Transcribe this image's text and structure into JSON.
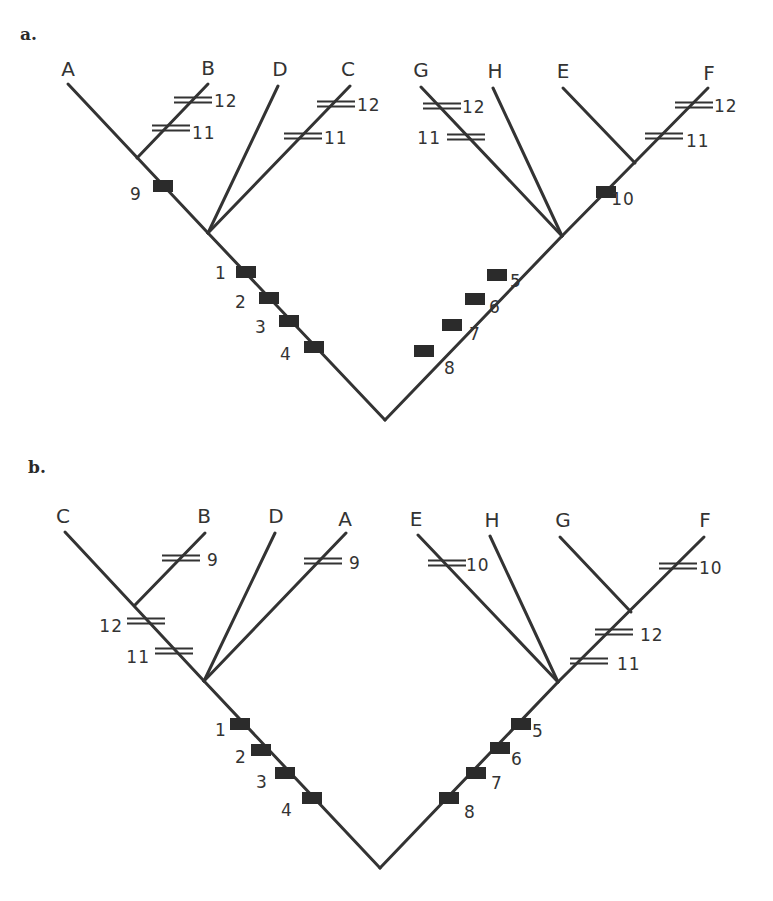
{
  "figure": {
    "panels": [
      {
        "id": "a",
        "label": "a.",
        "label_pos": [
          20,
          40
        ],
        "root": [
          385,
          420
        ],
        "branches": [
          {
            "from": [
              385,
              420
            ],
            "to": [
              208,
              233
            ]
          },
          {
            "from": [
              208,
              233
            ],
            "to": [
              68,
              84
            ]
          },
          {
            "from": [
              137,
              158
            ],
            "to": [
              208,
              84
            ]
          },
          {
            "from": [
              208,
              233
            ],
            "to": [
              278,
              86
            ]
          },
          {
            "from": [
              208,
              233
            ],
            "to": [
              350,
              86
            ]
          },
          {
            "from": [
              385,
              420
            ],
            "to": [
              562,
              236
            ]
          },
          {
            "from": [
              562,
              236
            ],
            "to": [
              421,
              87
            ]
          },
          {
            "from": [
              562,
              236
            ],
            "to": [
              493,
              88
            ]
          },
          {
            "from": [
              562,
              236
            ],
            "to": [
              708,
              88
            ]
          },
          {
            "from": [
              635,
              163
            ],
            "to": [
              563,
              88
            ]
          }
        ],
        "taxa": [
          {
            "name": "A",
            "x": 68,
            "y": 76
          },
          {
            "name": "B",
            "x": 208,
            "y": 75
          },
          {
            "name": "D",
            "x": 280,
            "y": 76
          },
          {
            "name": "C",
            "x": 348,
            "y": 76
          },
          {
            "name": "G",
            "x": 421,
            "y": 77
          },
          {
            "name": "H",
            "x": 495,
            "y": 78
          },
          {
            "name": "E",
            "x": 563,
            "y": 78
          },
          {
            "name": "F",
            "x": 709,
            "y": 80
          }
        ],
        "boxes": [
          {
            "label": "9",
            "x": 163,
            "y": 186,
            "lx": 136,
            "ly": 200
          },
          {
            "label": "1",
            "x": 246,
            "y": 272,
            "lx": 221,
            "ly": 279
          },
          {
            "label": "2",
            "x": 269,
            "y": 298,
            "lx": 241,
            "ly": 308
          },
          {
            "label": "3",
            "x": 289,
            "y": 321,
            "lx": 261,
            "ly": 333
          },
          {
            "label": "4",
            "x": 314,
            "y": 347,
            "lx": 286,
            "ly": 360
          },
          {
            "label": "10",
            "x": 606,
            "y": 192,
            "lx": 623,
            "ly": 205
          },
          {
            "label": "5",
            "x": 497,
            "y": 275,
            "lx": 516,
            "ly": 287
          },
          {
            "label": "6",
            "x": 475,
            "y": 299,
            "lx": 495,
            "ly": 313
          },
          {
            "label": "7",
            "x": 452,
            "y": 325,
            "lx": 475,
            "ly": 340
          },
          {
            "label": "8",
            "x": 424,
            "y": 351,
            "lx": 450,
            "ly": 374
          }
        ],
        "hashes": [
          {
            "label": "12",
            "x": 193,
            "y": 100,
            "lx": 214,
            "ly": 107,
            "anchor": "start"
          },
          {
            "label": "11",
            "x": 171,
            "y": 128,
            "lx": 192,
            "ly": 139,
            "anchor": "start"
          },
          {
            "label": "12",
            "x": 336,
            "y": 104,
            "lx": 357,
            "ly": 111,
            "anchor": "start"
          },
          {
            "label": "11",
            "x": 303,
            "y": 136,
            "lx": 324,
            "ly": 144,
            "anchor": "start"
          },
          {
            "label": "12",
            "x": 442,
            "y": 106,
            "lx": 462,
            "ly": 113,
            "anchor": "start"
          },
          {
            "label": "11",
            "x": 466,
            "y": 137,
            "lx": 441,
            "ly": 144,
            "anchor": "end"
          },
          {
            "label": "12",
            "x": 694,
            "y": 105,
            "lx": 714,
            "ly": 112,
            "anchor": "start"
          },
          {
            "label": "11",
            "x": 664,
            "y": 136,
            "lx": 686,
            "ly": 147,
            "anchor": "start"
          }
        ]
      },
      {
        "id": "b",
        "label": "b.",
        "label_pos": [
          28,
          473
        ],
        "root": [
          380,
          868
        ],
        "branches": [
          {
            "from": [
              380,
              868
            ],
            "to": [
              204,
              681
            ]
          },
          {
            "from": [
              204,
              681
            ],
            "to": [
              65,
              532
            ]
          },
          {
            "from": [
              135,
              605
            ],
            "to": [
              205,
              533
            ]
          },
          {
            "from": [
              204,
              681
            ],
            "to": [
              275,
              533
            ]
          },
          {
            "from": [
              204,
              681
            ],
            "to": [
              346,
              533
            ]
          },
          {
            "from": [
              380,
              868
            ],
            "to": [
              558,
              682
            ]
          },
          {
            "from": [
              558,
              682
            ],
            "to": [
              418,
              535
            ]
          },
          {
            "from": [
              558,
              682
            ],
            "to": [
              490,
              536
            ]
          },
          {
            "from": [
              558,
              682
            ],
            "to": [
              704,
              537
            ]
          },
          {
            "from": [
              631,
              612
            ],
            "to": [
              560,
              537
            ]
          }
        ],
        "taxa": [
          {
            "name": "C",
            "x": 63,
            "y": 523
          },
          {
            "name": "B",
            "x": 204,
            "y": 523
          },
          {
            "name": "D",
            "x": 276,
            "y": 523
          },
          {
            "name": "A",
            "x": 345,
            "y": 526
          },
          {
            "name": "E",
            "x": 416,
            "y": 526
          },
          {
            "name": "H",
            "x": 492,
            "y": 527
          },
          {
            "name": "G",
            "x": 563,
            "y": 527
          },
          {
            "name": "F",
            "x": 705,
            "y": 527
          }
        ],
        "boxes": [
          {
            "label": "1",
            "x": 240,
            "y": 724,
            "lx": 221,
            "ly": 736
          },
          {
            "label": "2",
            "x": 261,
            "y": 750,
            "lx": 241,
            "ly": 763
          },
          {
            "label": "3",
            "x": 285,
            "y": 773,
            "lx": 262,
            "ly": 788
          },
          {
            "label": "4",
            "x": 312,
            "y": 798,
            "lx": 287,
            "ly": 816
          },
          {
            "label": "5",
            "x": 521,
            "y": 724,
            "lx": 538,
            "ly": 737
          },
          {
            "label": "6",
            "x": 500,
            "y": 748,
            "lx": 517,
            "ly": 765
          },
          {
            "label": "7",
            "x": 476,
            "y": 773,
            "lx": 497,
            "ly": 789
          },
          {
            "label": "8",
            "x": 449,
            "y": 798,
            "lx": 470,
            "ly": 818
          }
        ],
        "hashes": [
          {
            "label": "9",
            "x": 181,
            "y": 558,
            "lx": 207,
            "ly": 566,
            "anchor": "start"
          },
          {
            "label": "9",
            "x": 323,
            "y": 561,
            "lx": 349,
            "ly": 569,
            "anchor": "start"
          },
          {
            "label": "12",
            "x": 146,
            "y": 621,
            "lx": 123,
            "ly": 632,
            "anchor": "end"
          },
          {
            "label": "11",
            "x": 174,
            "y": 651,
            "lx": 150,
            "ly": 663,
            "anchor": "end"
          },
          {
            "label": "10",
            "x": 447,
            "y": 563,
            "lx": 466,
            "ly": 571,
            "anchor": "start"
          },
          {
            "label": "10",
            "x": 678,
            "y": 566,
            "lx": 699,
            "ly": 574,
            "anchor": "start"
          },
          {
            "label": "12",
            "x": 614,
            "y": 632,
            "lx": 640,
            "ly": 641,
            "anchor": "start"
          },
          {
            "label": "11",
            "x": 589,
            "y": 661,
            "lx": 617,
            "ly": 670,
            "anchor": "start"
          }
        ]
      }
    ]
  }
}
